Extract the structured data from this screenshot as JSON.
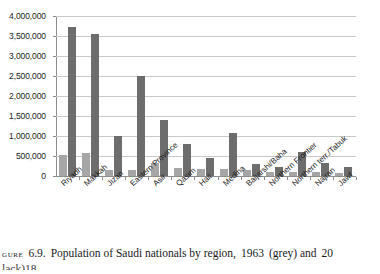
{
  "chart_data": {
    "type": "bar",
    "title": "",
    "xlabel": "",
    "ylabel": "",
    "ylim": [
      0,
      4000000
    ],
    "grid": true,
    "legend_position": "none",
    "categories": [
      "Riyadh",
      "Makkah",
      "Jizan",
      "Eastern Province",
      "Asir",
      "Qasim",
      "Hail",
      "Medina",
      "Baljarshi/Baha",
      "Northern Frontier",
      "Northern terr./Tabuk",
      "Najran",
      "Jawf"
    ],
    "ytick_labels": [
      "4,000,000",
      "3,500,000",
      "3,000,000",
      "2,500,000",
      "2,000,000",
      "1,500,000",
      "1,000,000",
      "500,000",
      "0"
    ],
    "ytick_values": [
      4000000,
      3500000,
      3000000,
      2500000,
      2000000,
      1500000,
      1000000,
      500000,
      0
    ],
    "series": [
      {
        "name": "1963",
        "color": "#a6a6a6",
        "values": [
          520000,
          580000,
          160000,
          140000,
          330000,
          200000,
          170000,
          170000,
          150000,
          90000,
          100000,
          110000,
          80000
        ]
      },
      {
        "name": "2004",
        "color": "#6d6d6d",
        "values": [
          3720000,
          3560000,
          1000000,
          2500000,
          1400000,
          800000,
          450000,
          1080000,
          300000,
          220000,
          600000,
          320000,
          230000
        ]
      }
    ]
  },
  "caption": {
    "figure_word": "gure",
    "number": "6.9.",
    "text_part1": "Population of Saudi nationals by region,",
    "year1": "1963",
    "year1_note": "(grey) and",
    "year2_partial": "20",
    "line2_partial": "lack)",
    "footnote_marker": "18"
  }
}
